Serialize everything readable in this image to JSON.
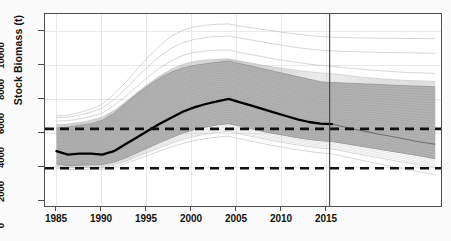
{
  "chart_data": {
    "type": "line",
    "title": "",
    "xlabel": "",
    "ylabel": "Stock Biomass (t)",
    "xlim": [
      1984.0,
      1984.0
    ],
    "ylim": [
      0,
      11200
    ],
    "grid": true,
    "legend": "none",
    "x_ticks": [
      1985,
      1990,
      1995,
      2000,
      2005,
      2010,
      2015
    ],
    "x_tick_labels": [
      "1985",
      "1990",
      "1995",
      "2000",
      "2005",
      "2010",
      "2015"
    ],
    "y_ticks": [
      0,
      2000,
      4000,
      6000,
      8000,
      10000
    ],
    "y_tick_labels": [
      "0",
      "2000",
      "4000",
      "6000",
      "8000",
      "10000"
    ],
    "x_start": 1984.0,
    "x_end": 1984.0,
    "x_axis_min": 1984.0,
    "x_axis_max": 2018.5,
    "annotations": {
      "divider_year": 2008.8,
      "divider_note": "vertical line separating historical assessment from projection",
      "upper_reference_line_value": 4500,
      "lower_reference_line_value": 2200,
      "shaded_band_note": "grey envelope of simulated stock biomass trajectories"
    },
    "x": [
      1985,
      1986,
      1987,
      1988,
      1989,
      1990,
      1991,
      1992,
      1993,
      1994,
      1995,
      1996,
      1997,
      1998,
      1999,
      2000,
      2001,
      2002,
      2003,
      2004,
      2005,
      2006,
      2007,
      2008,
      2009,
      2010,
      2011,
      2012,
      2013,
      2014,
      2015,
      2016,
      2017,
      2018
    ],
    "series": [
      {
        "name": "Median stock biomass (historical)",
        "style": "thick black line",
        "values": [
          3200,
          3000,
          3050,
          3050,
          3000,
          3200,
          3600,
          4000,
          4400,
          4800,
          5150,
          5500,
          5750,
          5950,
          6100,
          6250,
          6050,
          5850,
          5650,
          5450,
          5250,
          5050,
          4900,
          4800,
          4780,
          null,
          null,
          null,
          null,
          null,
          null,
          null,
          null,
          null
        ]
      },
      {
        "name": "Median stock biomass (projection)",
        "style": "grey line",
        "values": [
          null,
          null,
          null,
          null,
          null,
          null,
          null,
          null,
          null,
          null,
          null,
          null,
          null,
          null,
          null,
          null,
          null,
          null,
          null,
          null,
          null,
          null,
          null,
          null,
          4780,
          4620,
          4480,
          4340,
          4200,
          4080,
          3950,
          3820,
          3700,
          3600
        ]
      },
      {
        "name": "Envelope upper bound",
        "style": "grey band top",
        "values": [
          4550,
          4600,
          4700,
          4800,
          5000,
          5400,
          5950,
          6500,
          7000,
          7450,
          7800,
          8050,
          8200,
          8300,
          8380,
          8450,
          8300,
          8150,
          8000,
          7850,
          7700,
          7550,
          7400,
          7250,
          7200,
          7180,
          7150,
          7120,
          7090,
          7060,
          7030,
          7000,
          6980,
          6950
        ]
      },
      {
        "name": "Envelope lower bound",
        "style": "grey band bottom",
        "values": [
          2450,
          2350,
          2380,
          2400,
          2420,
          2560,
          2800,
          3100,
          3400,
          3700,
          3980,
          4250,
          4450,
          4600,
          4720,
          4800,
          4650,
          4500,
          4350,
          4220,
          4100,
          3980,
          3880,
          3800,
          3760,
          3650,
          3540,
          3430,
          3320,
          3210,
          3100,
          2990,
          2880,
          2750
        ]
      },
      {
        "name": "Outer trajectory 1 (highest)",
        "style": "thin grey",
        "values": [
          5250,
          5300,
          5450,
          5650,
          5950,
          6500,
          7200,
          7950,
          8700,
          9350,
          9900,
          10250,
          10450,
          10550,
          10600,
          10620,
          10500,
          10400,
          10300,
          10200,
          10100,
          10020,
          9950,
          9880,
          9850,
          9830,
          9810,
          9800,
          9790,
          9780,
          9775,
          9770,
          9765,
          9760
        ]
      },
      {
        "name": "Outer trajectory 2",
        "style": "thin grey",
        "values": [
          5150,
          5180,
          5300,
          5470,
          5720,
          6200,
          6820,
          7500,
          8150,
          8730,
          9200,
          9520,
          9720,
          9830,
          9890,
          9920,
          9800,
          9680,
          9560,
          9450,
          9340,
          9240,
          9160,
          9090,
          9050,
          9020,
          9000,
          8980,
          8965,
          8950,
          8940,
          8930,
          8920,
          8910
        ]
      },
      {
        "name": "Outer trajectory 3",
        "style": "thin grey",
        "values": [
          4950,
          4980,
          5080,
          5220,
          5430,
          5840,
          6380,
          6970,
          7540,
          8050,
          8470,
          8780,
          8960,
          9050,
          9090,
          9100,
          8960,
          8830,
          8700,
          8580,
          8470,
          8370,
          8280,
          8200,
          8150,
          8080,
          8010,
          7950,
          7900,
          7850,
          7810,
          7780,
          7760,
          7740
        ]
      },
      {
        "name": "Outer trajectory 4",
        "style": "thin grey",
        "values": [
          4750,
          4780,
          4870,
          5000,
          5190,
          5570,
          6060,
          6600,
          7120,
          7590,
          7980,
          8260,
          8430,
          8520,
          8560,
          8580,
          8450,
          8330,
          8210,
          8100,
          8000,
          7910,
          7830,
          7760,
          7720,
          7640,
          7560,
          7490,
          7430,
          7380,
          7340,
          7310,
          7290,
          7270
        ]
      },
      {
        "name": "Lower outer trajectory 1",
        "style": "thin grey",
        "values": [
          2300,
          2220,
          2240,
          2250,
          2260,
          2380,
          2600,
          2870,
          3140,
          3400,
          3650,
          3880,
          4060,
          4190,
          4290,
          4350,
          4200,
          4060,
          3920,
          3790,
          3670,
          3560,
          3460,
          3380,
          3330,
          3200,
          3070,
          2940,
          2820,
          2700,
          2580,
          2470,
          2360,
          2250
        ]
      },
      {
        "name": "Lower outer trajectory 2 (lowest)",
        "style": "thin grey",
        "values": [
          2200,
          2120,
          2140,
          2150,
          2160,
          2270,
          2470,
          2720,
          2970,
          3210,
          3440,
          3650,
          3810,
          3930,
          4020,
          4070,
          3920,
          3780,
          3640,
          3510,
          3390,
          3280,
          3180,
          3100,
          3050,
          2900,
          2750,
          2610,
          2470,
          2330,
          2200,
          2070,
          1950,
          1830
        ]
      }
    ]
  },
  "colors": {
    "band": "#a9a9a9",
    "median": "#000000",
    "reference_line": "#111111",
    "axis": "#4d4d4d",
    "background": "#ffffff"
  }
}
